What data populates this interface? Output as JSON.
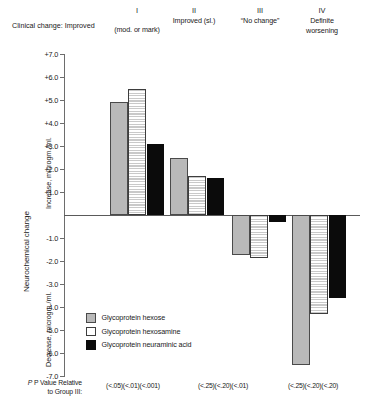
{
  "chart_data": {
    "type": "bar",
    "title": "",
    "xlabel": "Clinical change",
    "ylabel": "Neurochemical change",
    "ylabel_upper": "Increase, microgm./ml.",
    "ylabel_lower": "Decrease, microgm./ml.",
    "ylim": [
      -7.0,
      7.0
    ],
    "grid": false,
    "legend_position": "lower-left-inside",
    "ytick_labels": [
      "+7.0",
      "+6.0",
      "+5.0",
      "+4.0",
      "+3.0",
      "+2.0",
      "+1.0",
      "-1.0",
      "-2.0",
      "-3.0",
      "-4.0",
      "-5.0",
      "-6.0",
      "-7.0"
    ],
    "ytick_values": [
      7,
      6,
      5,
      4,
      3,
      2,
      1,
      -1,
      -2,
      -3,
      -4,
      -5,
      -6,
      -7
    ],
    "categories": [
      "I",
      "II",
      "III",
      "IV"
    ],
    "category_sublabels": [
      "Clinical change: Improved (mod. or mark)",
      "Improved (sl.)",
      "“No change”",
      "Definite worsening"
    ],
    "series": [
      {
        "name": "Glycoprotein hexose",
        "values": [
          4.9,
          2.5,
          -1.75,
          -6.5
        ]
      },
      {
        "name": "Glycoprotein hexosamine",
        "values": [
          5.5,
          1.7,
          -1.85,
          -4.3
        ]
      },
      {
        "name": "Glycoprotein neuraminic acid",
        "values": [
          3.1,
          1.6,
          -0.3,
          -3.6
        ]
      }
    ],
    "annotations": {
      "pvalue_row_label": "P Value Relative to Group III:",
      "pvalue_by_group": [
        "(<.05)(<.01)(<.001)",
        "(<.25)(<.20)(<.01)",
        "",
        "(<.25)(<.20)(<.20)"
      ]
    }
  },
  "headers": {
    "clinical_prefix": "Clinical change: Improved",
    "groups": [
      {
        "roman": "I",
        "label_line1": "(mod. or mark)",
        "label_line2": ""
      },
      {
        "roman": "II",
        "label_line1": "Improved (sl.)",
        "label_line2": ""
      },
      {
        "roman": "III",
        "label_line1": "“No change”",
        "label_line2": ""
      },
      {
        "roman": "IV",
        "label_line1": "Definite",
        "label_line2": "worsening"
      }
    ]
  },
  "axis": {
    "main_title": "Neurochemical change",
    "upper_title": "Increase, microgm./ml.",
    "lower_title": "Decrease, microgm./ml.",
    "ticks": [
      {
        "label": "+7.0",
        "value": 7
      },
      {
        "label": "+6.0",
        "value": 6
      },
      {
        "label": "+5.0",
        "value": 5
      },
      {
        "label": "+4.0",
        "value": 4
      },
      {
        "label": "+3.0",
        "value": 3
      },
      {
        "label": "+2.0",
        "value": 2
      },
      {
        "label": "+1.0",
        "value": 1
      },
      {
        "label": "-1.0",
        "value": -1
      },
      {
        "label": "-2.0",
        "value": -2
      },
      {
        "label": "-3.0",
        "value": -3
      },
      {
        "label": "-4.0",
        "value": -4
      },
      {
        "label": "-5.0",
        "value": -5
      },
      {
        "label": "-6.0",
        "value": -6
      },
      {
        "label": "-7.0",
        "value": -7
      }
    ]
  },
  "legend": {
    "items": [
      {
        "label": "Glycoprotein hexose",
        "swatch": "hexose"
      },
      {
        "label": "Glycoprotein hexosamine",
        "swatch": "hexosamine"
      },
      {
        "label": "Glycoprotein neuraminic acid",
        "swatch": "neuraminic"
      }
    ]
  },
  "pvalues": {
    "row_label_line1": "P Value Relative",
    "row_label_line2": "to Group III:",
    "cells": [
      {
        "group": "I",
        "text": "(<.05)(<.01)(<.001)"
      },
      {
        "group": "II",
        "text": "(<.25)(<.20)(<.01)"
      },
      {
        "group": "IV",
        "text": "(<.25)(<.20)(<.20)"
      }
    ]
  },
  "colors": {
    "hexose": "#b9b9b9",
    "hexosamine": "#ffffff",
    "neuraminic": "#0b0b0b",
    "axis": "#6d6d6d",
    "text": "#1a1a1a"
  }
}
